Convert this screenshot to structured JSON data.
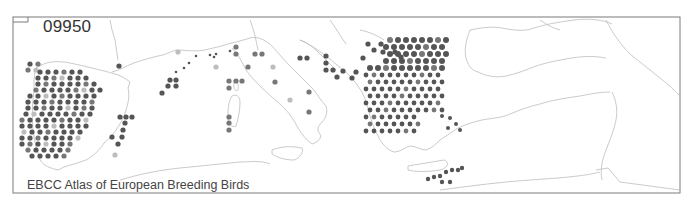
{
  "map": {
    "species_code": "09950",
    "credit": "EBCC Atlas of European Breeding Birds",
    "region": "Mediterranean / Southern Europe",
    "frame": {
      "left": 13,
      "top": 17,
      "right": 680,
      "bottom": 193
    },
    "colors": {
      "frame": "#777777",
      "coast": "#bbbbbb",
      "dot_dark": "#555555",
      "dot_mid": "#777777",
      "dot_light": "#bdbdbd"
    },
    "legend_categories": [
      "dark: confirmed breeding",
      "mid: probable breeding",
      "light: possible breeding",
      "small: other/low"
    ]
  }
}
